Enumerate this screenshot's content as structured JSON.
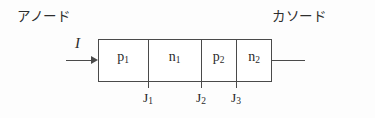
{
  "figure": {
    "background_color": "#fdfdfd",
    "line_color": "#4a4a4a",
    "text_color": "#2b2b2b"
  },
  "terminals": {
    "anode_label": "アノード",
    "cathode_label": "カソード"
  },
  "current": {
    "symbol": "I",
    "direction": "right"
  },
  "layers": [
    {
      "name": "p1",
      "base": "p",
      "sub": "1"
    },
    {
      "name": "n1",
      "base": "n",
      "sub": "1"
    },
    {
      "name": "p2",
      "base": "p",
      "sub": "2"
    },
    {
      "name": "n2",
      "base": "n",
      "sub": "2"
    }
  ],
  "junctions": [
    {
      "name": "J1",
      "base": "J",
      "sub": "1"
    },
    {
      "name": "J2",
      "base": "J",
      "sub": "2"
    },
    {
      "name": "J3",
      "base": "J",
      "sub": "3"
    }
  ]
}
